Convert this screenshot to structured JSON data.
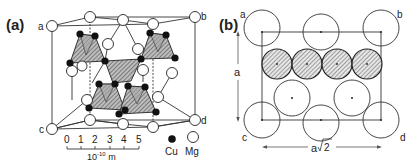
{
  "figure": {
    "panel_a": {
      "label": "(a)",
      "corners": {
        "a": "a",
        "b": "b",
        "c": "c",
        "d": "d"
      },
      "scale_bar": {
        "ticks": [
          "0",
          "1",
          "2",
          "3",
          "4",
          "5"
        ],
        "unit": "10",
        "unit_exp": "-10",
        "unit_suffix": " m"
      },
      "legend": [
        {
          "symbol": "filled-circle",
          "label": "Cu",
          "color": "#111111"
        },
        {
          "symbol": "open-circle",
          "label": "Mg",
          "color": "#ffffff"
        }
      ]
    },
    "panel_b": {
      "label": "(b)",
      "corners": {
        "a": "a",
        "b": "b",
        "c": "c",
        "d": "d"
      },
      "vertical_dimension": "a",
      "horizontal_dimension_base": "a",
      "horizontal_dimension_sqrt": "2"
    }
  },
  "colors": {
    "line": "#333333",
    "tetra_fill": "#9a9a9a",
    "hatch": "#444444",
    "background": "#ffffff"
  }
}
